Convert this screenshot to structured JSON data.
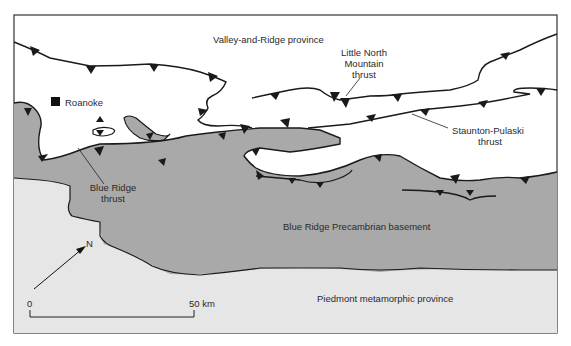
{
  "map": {
    "colors": {
      "valley_and_ridge": "#ffffff",
      "blue_ridge": "#a9a9a9",
      "piedmont": "#e6e6e6",
      "line": "#1a1a1a",
      "background": "#ffffff"
    },
    "labels": {
      "valley_and_ridge": "Valley-and-Ridge province",
      "little_north_mountain_1": "Little North",
      "little_north_mountain_2": "Mountain",
      "little_north_mountain_3": "thrust",
      "staunton_pulaski_1": "Staunton-Pulaski",
      "staunton_pulaski_2": "thrust",
      "roanoke": "Roanoke",
      "blue_ridge_thrust_1": "Blue Ridge",
      "blue_ridge_thrust_2": "thrust",
      "blue_ridge_basement": "Blue Ridge Precambrian basement",
      "piedmont": "Piedmont metamorphic province",
      "north": "N"
    },
    "scale_bar": {
      "start_label": "0",
      "end_label": "50 km"
    }
  }
}
